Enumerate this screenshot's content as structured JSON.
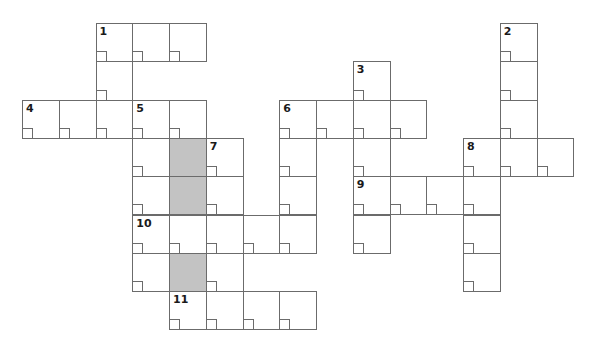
{
  "puzzle": {
    "type": "crossword",
    "cell_width": 36.75,
    "cell_height": 38.3,
    "origin_x": 22,
    "origin_y": 23,
    "line_color": "#6b6b6b",
    "shaded_color": "#c3c3c3",
    "clue_numbers": [
      "1",
      "2",
      "3",
      "4",
      "5",
      "6",
      "7",
      "8",
      "9",
      "10",
      "11"
    ],
    "cells": [
      {
        "r": 0,
        "c": 2,
        "num": "1"
      },
      {
        "r": 0,
        "c": 3
      },
      {
        "r": 0,
        "c": 4
      },
      {
        "r": 0,
        "c": 13,
        "num": "2"
      },
      {
        "r": 1,
        "c": 2
      },
      {
        "r": 1,
        "c": 9,
        "num": "3"
      },
      {
        "r": 1,
        "c": 13
      },
      {
        "r": 2,
        "c": 0,
        "num": "4"
      },
      {
        "r": 2,
        "c": 1
      },
      {
        "r": 2,
        "c": 2
      },
      {
        "r": 2,
        "c": 3,
        "num": "5"
      },
      {
        "r": 2,
        "c": 4
      },
      {
        "r": 2,
        "c": 7,
        "num": "6"
      },
      {
        "r": 2,
        "c": 8
      },
      {
        "r": 2,
        "c": 9
      },
      {
        "r": 2,
        "c": 10
      },
      {
        "r": 2,
        "c": 13
      },
      {
        "r": 3,
        "c": 3
      },
      {
        "r": 3,
        "c": 4,
        "shaded": true
      },
      {
        "r": 3,
        "c": 5,
        "num": "7"
      },
      {
        "r": 3,
        "c": 7
      },
      {
        "r": 3,
        "c": 9
      },
      {
        "r": 3,
        "c": 12,
        "num": "8"
      },
      {
        "r": 3,
        "c": 13
      },
      {
        "r": 3,
        "c": 14
      },
      {
        "r": 4,
        "c": 3
      },
      {
        "r": 4,
        "c": 4,
        "shaded": true
      },
      {
        "r": 4,
        "c": 5
      },
      {
        "r": 4,
        "c": 7
      },
      {
        "r": 4,
        "c": 9,
        "num": "9"
      },
      {
        "r": 4,
        "c": 10
      },
      {
        "r": 4,
        "c": 11
      },
      {
        "r": 4,
        "c": 12
      },
      {
        "r": 5,
        "c": 3,
        "num": "10"
      },
      {
        "r": 5,
        "c": 4
      },
      {
        "r": 5,
        "c": 5
      },
      {
        "r": 5,
        "c": 6
      },
      {
        "r": 5,
        "c": 7
      },
      {
        "r": 5,
        "c": 9
      },
      {
        "r": 5,
        "c": 12
      },
      {
        "r": 6,
        "c": 3
      },
      {
        "r": 6,
        "c": 4,
        "shaded": true
      },
      {
        "r": 6,
        "c": 5
      },
      {
        "r": 6,
        "c": 12
      },
      {
        "r": 7,
        "c": 4,
        "num": "11"
      },
      {
        "r": 7,
        "c": 5
      },
      {
        "r": 7,
        "c": 6
      },
      {
        "r": 7,
        "c": 7
      }
    ],
    "entries": {
      "across": [
        {
          "num": "1",
          "row": 0,
          "col": 2,
          "length": 3
        },
        {
          "num": "4",
          "row": 2,
          "col": 0,
          "length": 5
        },
        {
          "num": "6",
          "row": 2,
          "col": 7,
          "length": 4
        },
        {
          "num": "8",
          "row": 3,
          "col": 12,
          "length": 3
        },
        {
          "num": "9",
          "row": 4,
          "col": 9,
          "length": 4
        },
        {
          "num": "10",
          "row": 5,
          "col": 3,
          "length": 5
        },
        {
          "num": "11",
          "row": 7,
          "col": 4,
          "length": 4
        }
      ],
      "down": [
        {
          "num": "1",
          "row": 0,
          "col": 2,
          "length": 3
        },
        {
          "num": "2",
          "row": 0,
          "col": 13,
          "length": 4
        },
        {
          "num": "3",
          "row": 1,
          "col": 9,
          "length": 5
        },
        {
          "num": "5",
          "row": 2,
          "col": 3,
          "length": 5
        },
        {
          "num": "6",
          "row": 2,
          "col": 7,
          "length": 4
        },
        {
          "num": "7",
          "row": 3,
          "col": 5,
          "length": 4
        },
        {
          "num": "8",
          "row": 3,
          "col": 12,
          "length": 4
        }
      ]
    }
  }
}
